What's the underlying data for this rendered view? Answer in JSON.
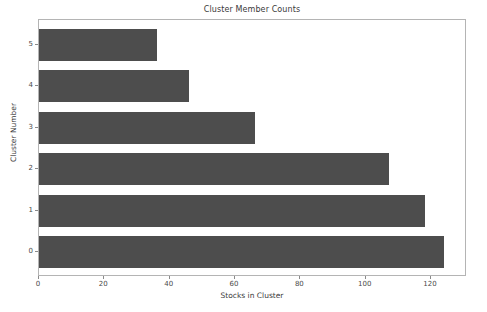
{
  "chart_data": {
    "type": "bar",
    "orientation": "horizontal",
    "title": "Cluster Member Counts",
    "xlabel": "Stocks in Cluster",
    "ylabel": "Cluster Number",
    "categories": [
      "0",
      "1",
      "2",
      "3",
      "4",
      "5"
    ],
    "values": [
      124,
      118,
      107,
      66,
      46,
      36
    ],
    "xlim": [
      0,
      131
    ],
    "ylim": [
      -0.6,
      5.6
    ],
    "xticks": [
      0,
      20,
      40,
      60,
      80,
      100,
      120
    ],
    "xtick_labels": [
      "0",
      "20",
      "40",
      "60",
      "80",
      "100",
      "120"
    ],
    "yticks": [
      0,
      1,
      2,
      3,
      4,
      5
    ],
    "ytick_labels": [
      "0",
      "1",
      "2",
      "3",
      "4",
      "5"
    ],
    "grid": false,
    "legend": false,
    "bar_color": "#4d4d4d",
    "background_color": "#ffffff",
    "axes_edge_color": "#b4b4b4"
  }
}
